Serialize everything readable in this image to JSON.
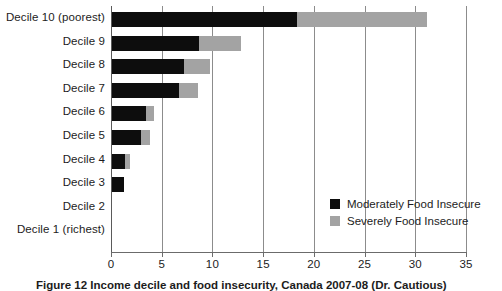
{
  "chart_data": {
    "type": "bar",
    "orientation": "horizontal",
    "stacked": true,
    "title": "",
    "subtitle": "",
    "xlabel": "",
    "ylabel": "",
    "xlim": [
      0,
      35
    ],
    "xticks": [
      0,
      5,
      10,
      15,
      20,
      25,
      30,
      35
    ],
    "xtick_labels": [
      "0",
      "5",
      "10",
      "15",
      "20",
      "25",
      "30",
      "35"
    ],
    "grid": true,
    "grid_axis": "x",
    "legend_position": "inside-bottom-right",
    "categories": [
      "Decile 10 (poorest)",
      "Decile 9",
      "Decile 8",
      "Decile 7",
      "Decile 6",
      "Decile 5",
      "Decile 4",
      "Decile 3",
      "Decile 2",
      "Decile 1 (richest)"
    ],
    "series": [
      {
        "name": "Moderately Food Insecure",
        "color": "#0d0d0d",
        "values": [
          18.2,
          8.6,
          7.1,
          6.6,
          3.4,
          2.9,
          1.3,
          1.2,
          0,
          0
        ]
      },
      {
        "name": "Severely Food Insecure",
        "color": "#a3a3a3",
        "values": [
          12.9,
          4.1,
          2.6,
          1.9,
          0.7,
          0.8,
          0.5,
          0,
          0,
          0
        ]
      }
    ],
    "totals": [
      31.1,
      12.7,
      9.7,
      8.5,
      4.1,
      3.7,
      1.8,
      1.2,
      0,
      0
    ]
  },
  "legend": {
    "items": [
      {
        "label": "Moderately Food Insecure",
        "swatch": "moderate"
      },
      {
        "label": "Severely Food Insecure",
        "swatch": "severe"
      }
    ]
  },
  "caption": {
    "text": "Figure 12 Income decile and food insecurity, Canada 2007-08 (Dr. Cautious)"
  },
  "colors": {
    "moderate": "#0d0d0d",
    "severe": "#a3a3a3",
    "grid": "#8c8c8c",
    "axis": "#6b6b6b",
    "text": "#1c1c1c",
    "background": "#ffffff"
  }
}
